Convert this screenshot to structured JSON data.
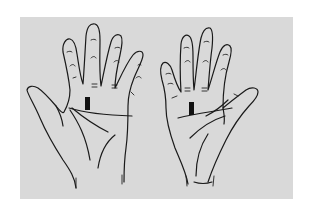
{
  "figure": {
    "type": "palm-line illustration",
    "background_color": "#d9d9d9",
    "line_color": "#1a1a1a",
    "hands": [
      {
        "side": "left",
        "label": "",
        "marker": "black rectangular mark below index/middle finger base"
      },
      {
        "side": "right",
        "label": "",
        "marker": "black rectangular mark below index/middle finger base"
      }
    ]
  }
}
